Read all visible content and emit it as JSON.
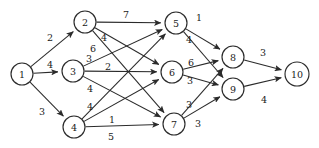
{
  "diagram": {
    "type": "directed-weighted-graph",
    "background_color": "#ffffff",
    "stroke_color": "#2b2b2b",
    "text_color": "#1a1a1a",
    "node_radius": 11,
    "nodes": [
      {
        "id": "1",
        "label": "1",
        "x": 22,
        "y": 74,
        "r": 11,
        "layer": 0
      },
      {
        "id": "2",
        "label": "2",
        "x": 85,
        "y": 22,
        "r": 11,
        "layer": 1
      },
      {
        "id": "3",
        "label": "3",
        "x": 73,
        "y": 71,
        "r": 11,
        "layer": 1
      },
      {
        "id": "4",
        "label": "4",
        "x": 74,
        "y": 127,
        "r": 11,
        "layer": 1
      },
      {
        "id": "5",
        "label": "5",
        "x": 176,
        "y": 23,
        "r": 11,
        "layer": 2
      },
      {
        "id": "6",
        "label": "6",
        "x": 172,
        "y": 72,
        "r": 11,
        "layer": 2
      },
      {
        "id": "7",
        "label": "7",
        "x": 174,
        "y": 124,
        "r": 11,
        "layer": 2
      },
      {
        "id": "8",
        "label": "8",
        "x": 233,
        "y": 57,
        "r": 11,
        "layer": 3
      },
      {
        "id": "9",
        "label": "9",
        "x": 233,
        "y": 89,
        "r": 11,
        "layer": 3
      },
      {
        "id": "10",
        "label": "10",
        "x": 297,
        "y": 74,
        "r": 12,
        "layer": 4
      }
    ],
    "edges": [
      {
        "from": "1",
        "to": "2",
        "weight": "2",
        "lx": 50,
        "ly": 37
      },
      {
        "from": "1",
        "to": "3",
        "weight": "4",
        "lx": 50,
        "ly": 64
      },
      {
        "from": "1",
        "to": "4",
        "weight": "3",
        "lx": 42,
        "ly": 111
      },
      {
        "from": "2",
        "to": "5",
        "weight": "7",
        "lx": 126,
        "ly": 14
      },
      {
        "from": "2",
        "to": "6",
        "weight": "4",
        "lx": 104,
        "ly": 37
      },
      {
        "from": "2",
        "to": "7",
        "weight": "6",
        "lx": 93,
        "ly": 48
      },
      {
        "from": "3",
        "to": "5",
        "weight": "3",
        "lx": 89,
        "ly": 58
      },
      {
        "from": "3",
        "to": "6",
        "weight": "2",
        "lx": 108,
        "ly": 66
      },
      {
        "from": "3",
        "to": "7",
        "weight": "4",
        "lx": 90,
        "ly": 88
      },
      {
        "from": "4",
        "to": "5",
        "weight": "4",
        "lx": 90,
        "ly": 106
      },
      {
        "from": "4",
        "to": "6",
        "weight": "1",
        "lx": 112,
        "ly": 119
      },
      {
        "from": "4",
        "to": "7",
        "weight": "5",
        "lx": 111,
        "ly": 136
      },
      {
        "from": "5",
        "to": "8",
        "weight": "1",
        "lx": 199,
        "ly": 17
      },
      {
        "from": "5",
        "to": "9",
        "weight": "4",
        "lx": 189,
        "ly": 39
      },
      {
        "from": "6",
        "to": "8",
        "weight": "6",
        "lx": 191,
        "ly": 62
      },
      {
        "from": "6",
        "to": "9",
        "weight": "3",
        "lx": 190,
        "ly": 80
      },
      {
        "from": "7",
        "to": "8",
        "weight": "3",
        "lx": 189,
        "ly": 104
      },
      {
        "from": "7",
        "to": "9",
        "weight": "3",
        "lx": 198,
        "ly": 123
      },
      {
        "from": "8",
        "to": "10",
        "weight": "3",
        "lx": 263,
        "ly": 52
      },
      {
        "from": "9",
        "to": "10",
        "weight": "4",
        "lx": 264,
        "ly": 99
      }
    ]
  }
}
